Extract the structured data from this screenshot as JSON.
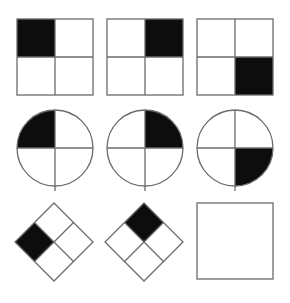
{
  "puzzle": {
    "title": "Raven's Progressive Matrices item",
    "type": "visual-analogy-matrix",
    "rows": 3,
    "columns": 3,
    "background_color": "#ffffff",
    "stroke_color": "#6b6b6b",
    "fill_color": "#0d0d0d",
    "stroke_width": 1.3,
    "cells": [
      {
        "id": "cell-r1c1",
        "name": "square-black-top-left",
        "shape": "square",
        "row": 1,
        "column": 1,
        "filled_quadrant": "top-left",
        "x": 17,
        "y": 19,
        "size": 76,
        "interactable": false
      },
      {
        "id": "cell-r1c2",
        "name": "square-black-top-right",
        "shape": "square",
        "row": 1,
        "column": 2,
        "filled_quadrant": "top-right",
        "x": 107,
        "y": 19,
        "size": 76,
        "interactable": false
      },
      {
        "id": "cell-r1c3",
        "name": "square-black-bottom-right",
        "shape": "square",
        "row": 1,
        "column": 3,
        "filled_quadrant": "bottom-right",
        "x": 197,
        "y": 19,
        "size": 76,
        "interactable": false
      },
      {
        "id": "cell-r2c1",
        "name": "circle-black-top-left",
        "shape": "circle",
        "row": 2,
        "column": 1,
        "filled_quadrant": "top-left",
        "x": 17,
        "y": 110,
        "size": 76,
        "interactable": false
      },
      {
        "id": "cell-r2c2",
        "name": "circle-black-top-right",
        "shape": "circle",
        "row": 2,
        "column": 2,
        "filled_quadrant": "top-right",
        "x": 107,
        "y": 110,
        "size": 76,
        "interactable": false
      },
      {
        "id": "cell-r2c3",
        "name": "circle-black-bottom-right",
        "shape": "circle",
        "row": 2,
        "column": 3,
        "filled_quadrant": "bottom-right",
        "x": 197,
        "y": 110,
        "size": 76,
        "interactable": false
      },
      {
        "id": "cell-r3c1",
        "name": "diamond-black-west",
        "shape": "diamond",
        "row": 3,
        "column": 1,
        "filled_quadrant": "west",
        "x": 15,
        "y": 203,
        "size": 78,
        "interactable": false
      },
      {
        "id": "cell-r3c2",
        "name": "diamond-black-north",
        "shape": "diamond",
        "row": 3,
        "column": 2,
        "filled_quadrant": "north",
        "x": 105,
        "y": 203,
        "size": 78,
        "interactable": false
      },
      {
        "id": "cell-r3c3",
        "name": "answer-blank-square",
        "shape": "blank-square",
        "row": 3,
        "column": 3,
        "filled_quadrant": "none",
        "x": 197,
        "y": 203,
        "size": 76,
        "interactable": true
      }
    ]
  }
}
